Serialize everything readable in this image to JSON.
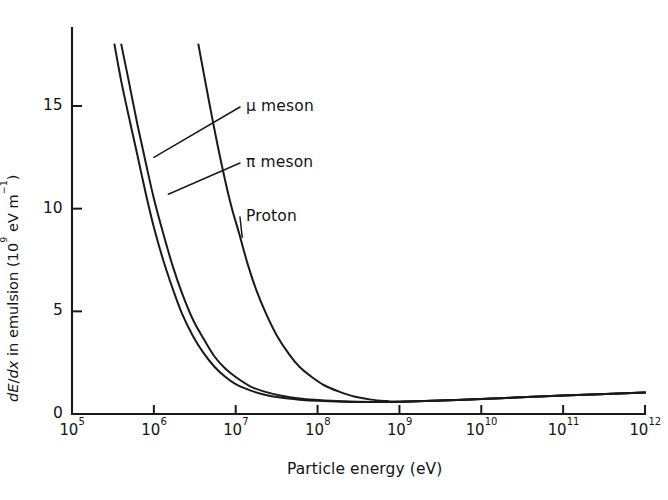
{
  "figure": {
    "background_color": "#ffffff",
    "ink_color": "#1a1a1a"
  },
  "chart_data": {
    "type": "line",
    "title": "",
    "subtitle": "",
    "xlabel": "Particle energy (eV)",
    "ylabel": "dE/dx in emulsion (10⁹ eV m⁻¹)",
    "ylabel_parts": {
      "italic_d1": "d",
      "italic_E": "E",
      "slash": "/",
      "italic_d2": "d",
      "italic_x": "x",
      "rest": " in emulsion (10",
      "exp1": "9",
      "mid": " eV m",
      "exp2": "−1",
      "close": ")"
    },
    "x_scale": "log10",
    "y_scale": "linear",
    "xlim": [
      100000,
      1000000000000
    ],
    "ylim": [
      0,
      18
    ],
    "grid": false,
    "legend_position": "inline-annotations",
    "x_tick_labels": [
      {
        "mantissa": "10",
        "exponent": "5",
        "value": 100000.0
      },
      {
        "mantissa": "10",
        "exponent": "6",
        "value": 1000000.0
      },
      {
        "mantissa": "10",
        "exponent": "7",
        "value": 10000000.0
      },
      {
        "mantissa": "10",
        "exponent": "8",
        "value": 100000000.0
      },
      {
        "mantissa": "10",
        "exponent": "9",
        "value": 1000000000.0
      },
      {
        "mantissa": "10",
        "exponent": "10",
        "value": 10000000000.0
      },
      {
        "mantissa": "10",
        "exponent": "11",
        "value": 100000000000.0
      },
      {
        "mantissa": "10",
        "exponent": "12",
        "value": 1000000000000.0
      }
    ],
    "y_tick_labels": [
      {
        "label": "0",
        "value": 0
      },
      {
        "label": "5",
        "value": 5
      },
      {
        "label": "10",
        "value": 10
      },
      {
        "label": "15",
        "value": 15
      }
    ],
    "series": [
      {
        "name": "μ meson",
        "label": "μ meson",
        "annotation_anchor_energy": 1000000,
        "annotation_anchor_value": 12.5,
        "points": [
          {
            "x": 330000,
            "y": 18.0
          },
          {
            "x": 400000,
            "y": 16.2
          },
          {
            "x": 500000,
            "y": 14.4
          },
          {
            "x": 630000,
            "y": 12.6
          },
          {
            "x": 800000,
            "y": 10.7
          },
          {
            "x": 1000000,
            "y": 9.1
          },
          {
            "x": 1300000,
            "y": 7.5
          },
          {
            "x": 1700000,
            "y": 6.1
          },
          {
            "x": 2200000,
            "y": 4.9
          },
          {
            "x": 3000000,
            "y": 3.8
          },
          {
            "x": 4000000,
            "y": 3.0
          },
          {
            "x": 5500000,
            "y": 2.3
          },
          {
            "x": 7500000,
            "y": 1.8
          },
          {
            "x": 10000000,
            "y": 1.45
          },
          {
            "x": 15000000,
            "y": 1.15
          },
          {
            "x": 22000000,
            "y": 0.95
          },
          {
            "x": 35000000,
            "y": 0.8
          },
          {
            "x": 60000000,
            "y": 0.7
          },
          {
            "x": 100000000,
            "y": 0.64
          },
          {
            "x": 200000000,
            "y": 0.6
          },
          {
            "x": 500000000,
            "y": 0.58
          },
          {
            "x": 1000000000,
            "y": 0.6
          },
          {
            "x": 5000000000,
            "y": 0.68
          },
          {
            "x": 20000000000,
            "y": 0.78
          },
          {
            "x": 100000000000,
            "y": 0.9
          },
          {
            "x": 1000000000000,
            "y": 1.05
          }
        ]
      },
      {
        "name": "π meson",
        "label": "π meson",
        "annotation_anchor_energy": 1500000,
        "annotation_anchor_value": 10.7,
        "points": [
          {
            "x": 400000,
            "y": 18.0
          },
          {
            "x": 500000,
            "y": 16.1
          },
          {
            "x": 630000,
            "y": 14.1
          },
          {
            "x": 800000,
            "y": 12.2
          },
          {
            "x": 1000000,
            "y": 10.5
          },
          {
            "x": 1300000,
            "y": 8.8
          },
          {
            "x": 1700000,
            "y": 7.2
          },
          {
            "x": 2200000,
            "y": 5.9
          },
          {
            "x": 3000000,
            "y": 4.6
          },
          {
            "x": 4000000,
            "y": 3.7
          },
          {
            "x": 5500000,
            "y": 2.8
          },
          {
            "x": 7500000,
            "y": 2.2
          },
          {
            "x": 10000000,
            "y": 1.8
          },
          {
            "x": 15000000,
            "y": 1.35
          },
          {
            "x": 22000000,
            "y": 1.1
          },
          {
            "x": 35000000,
            "y": 0.9
          },
          {
            "x": 60000000,
            "y": 0.75
          },
          {
            "x": 100000000,
            "y": 0.68
          },
          {
            "x": 200000000,
            "y": 0.62
          },
          {
            "x": 500000000,
            "y": 0.59
          },
          {
            "x": 1000000000,
            "y": 0.6
          },
          {
            "x": 5000000000,
            "y": 0.68
          },
          {
            "x": 20000000000,
            "y": 0.78
          },
          {
            "x": 100000000000,
            "y": 0.9
          },
          {
            "x": 1000000000000,
            "y": 1.05
          }
        ]
      },
      {
        "name": "Proton",
        "label": "Proton",
        "annotation_anchor_energy": 12000000,
        "annotation_anchor_value": 8.6,
        "points": [
          {
            "x": 3500000,
            "y": 18.0
          },
          {
            "x": 4200000,
            "y": 16.3
          },
          {
            "x": 5000000,
            "y": 14.7
          },
          {
            "x": 6000000,
            "y": 13.1
          },
          {
            "x": 7500000,
            "y": 11.3
          },
          {
            "x": 9000000,
            "y": 10.0
          },
          {
            "x": 11000000,
            "y": 8.8
          },
          {
            "x": 14000000,
            "y": 7.3
          },
          {
            "x": 18000000,
            "y": 6.0
          },
          {
            "x": 24000000,
            "y": 4.8
          },
          {
            "x": 32000000,
            "y": 3.8
          },
          {
            "x": 45000000,
            "y": 2.9
          },
          {
            "x": 60000000,
            "y": 2.3
          },
          {
            "x": 85000000,
            "y": 1.8
          },
          {
            "x": 120000000,
            "y": 1.4
          },
          {
            "x": 180000000,
            "y": 1.1
          },
          {
            "x": 280000000,
            "y": 0.85
          },
          {
            "x": 450000000,
            "y": 0.7
          },
          {
            "x": 700000000,
            "y": 0.63
          },
          {
            "x": 1000000000,
            "y": 0.6
          },
          {
            "x": 5000000000,
            "y": 0.68
          },
          {
            "x": 20000000000,
            "y": 0.78
          },
          {
            "x": 100000000000,
            "y": 0.9
          },
          {
            "x": 1000000000000,
            "y": 1.05
          }
        ]
      }
    ]
  }
}
